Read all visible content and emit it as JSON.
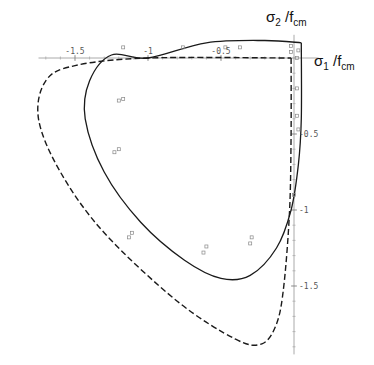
{
  "chart_data": {
    "type": "line",
    "title": "",
    "xlabel": "σ1 /fcm",
    "ylabel": "σ2 /fcm",
    "xlabel_parts": {
      "main": "σ",
      "sub1": "1",
      "slash": " /f",
      "sub2": "cm"
    },
    "ylabel_parts": {
      "main": "σ",
      "sub1": "2",
      "slash": " /f",
      "sub2": "cm"
    },
    "xlim": [
      -1.75,
      0.1
    ],
    "ylim": [
      -1.95,
      0.1
    ],
    "grid": false,
    "legend": null,
    "x_ticks": [
      {
        "value": -1.5,
        "label": "-1.5"
      },
      {
        "value": -1.0,
        "label": "-1"
      },
      {
        "value": -0.5,
        "label": "-0.5"
      }
    ],
    "y_ticks": [
      {
        "value": -0.5,
        "label": "-0.5"
      },
      {
        "value": -1.0,
        "label": "-1"
      },
      {
        "value": -1.5,
        "label": "-1.5"
      }
    ],
    "series": [
      {
        "name": "failure envelope (solid)",
        "style": "solid",
        "points": [
          [
            0.05,
            0.1
          ],
          [
            0.05,
            -0.4
          ],
          [
            0.03,
            -0.7
          ],
          [
            -0.02,
            -1.0
          ],
          [
            -0.12,
            -1.25
          ],
          [
            -0.3,
            -1.43
          ],
          [
            -0.5,
            -1.45
          ],
          [
            -0.75,
            -1.33
          ],
          [
            -1.05,
            -1.08
          ],
          [
            -1.3,
            -0.75
          ],
          [
            -1.43,
            -0.4
          ],
          [
            -1.4,
            -0.15
          ],
          [
            -1.25,
            0.02
          ],
          [
            -1.0,
            0.0
          ],
          [
            -0.6,
            0.1
          ],
          [
            -0.2,
            0.115
          ],
          [
            0.05,
            0.1
          ]
        ]
      },
      {
        "name": "failure envelope (dashed)",
        "style": "dashed",
        "points": [
          [
            -0.02,
            0.0
          ],
          [
            -0.02,
            -0.5
          ],
          [
            -0.03,
            -1.0
          ],
          [
            -0.07,
            -1.5
          ],
          [
            -0.12,
            -1.75
          ],
          [
            -0.22,
            -1.88
          ],
          [
            -0.4,
            -1.85
          ],
          [
            -0.8,
            -1.6
          ],
          [
            -1.3,
            -1.15
          ],
          [
            -1.6,
            -0.75
          ],
          [
            -1.75,
            -0.4
          ],
          [
            -1.7,
            -0.15
          ],
          [
            -1.5,
            -0.05
          ],
          [
            -1.0,
            0.0
          ],
          [
            -0.02,
            0.0
          ]
        ]
      }
    ],
    "markers": {
      "style": "open-square",
      "points": [
        [
          -1.2,
          -0.28
        ],
        [
          -1.17,
          -0.27
        ],
        [
          -1.23,
          -0.62
        ],
        [
          -1.2,
          -0.6
        ],
        [
          -1.11,
          -1.15
        ],
        [
          -1.13,
          -1.18
        ],
        [
          -0.62,
          -1.28
        ],
        [
          -0.6,
          -1.24
        ],
        [
          -0.3,
          -1.22
        ],
        [
          -0.29,
          -1.18
        ],
        [
          -1.17,
          0.07
        ],
        [
          -0.76,
          0.07
        ],
        [
          -0.47,
          0.07
        ],
        [
          -0.37,
          0.07
        ],
        [
          -0.02,
          0.08
        ],
        [
          -0.02,
          0.04
        ],
        [
          0.03,
          0.05
        ],
        [
          0.02,
          0.0
        ],
        [
          0.02,
          -0.2
        ],
        [
          0.02,
          -0.38
        ],
        [
          0.03,
          -0.47
        ],
        [
          0.0,
          -0.9
        ]
      ]
    },
    "origin_px": [
      294,
      58
    ],
    "scale_px": [
      146,
      152
    ]
  }
}
